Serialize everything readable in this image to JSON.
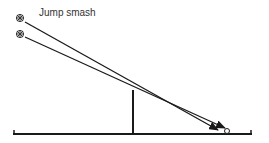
{
  "diagram": {
    "title": "Jump smash",
    "colors": {
      "line": "#1a1a1a",
      "text": "#333333",
      "background": "#ffffff"
    },
    "shuttlecocks": [
      {
        "name": "shuttle-start-high",
        "x": 20,
        "y": 18
      },
      {
        "name": "shuttle-start-low",
        "x": 20,
        "y": 34
      }
    ],
    "trajectories": [
      {
        "from": [
          25,
          22
        ],
        "to": [
          218,
          130
        ]
      },
      {
        "from": [
          25,
          37
        ],
        "to": [
          226,
          128
        ]
      }
    ],
    "net": {
      "x": 133,
      "top": 90,
      "bottom": 134
    },
    "court": {
      "y": 134,
      "left": 13,
      "right": 252
    },
    "landing_marker": {
      "x": 227,
      "y": 131,
      "r": 2.5
    }
  }
}
